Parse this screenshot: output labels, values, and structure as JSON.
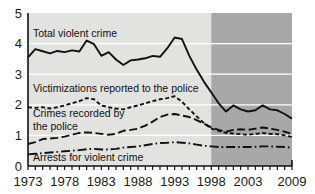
{
  "chart_data": {
    "type": "line",
    "title": "",
    "subtitle": "",
    "xlabel": "",
    "ylabel": "",
    "xlim": [
      1973,
      2009
    ],
    "ylim": [
      0,
      5
    ],
    "yticks": [
      "0",
      "1",
      "2",
      "3",
      "4",
      "5"
    ],
    "xticks": [
      "1973",
      "1978",
      "1983",
      "1988",
      "1993",
      "1998",
      "2003",
      "2009"
    ],
    "xtick_values": [
      1973,
      1978,
      1983,
      1988,
      1993,
      1998,
      2003,
      2009
    ],
    "grid": "horizontal white gridlines at 1,2,3,4",
    "legend": "inline annotations",
    "shaded_region": {
      "label": "",
      "from": 1998,
      "to": 2009,
      "color": "#a8a8a8"
    },
    "plot_background": "#e2e2e0",
    "x": [
      1973,
      1974,
      1975,
      1976,
      1977,
      1978,
      1979,
      1980,
      1981,
      1982,
      1983,
      1984,
      1985,
      1986,
      1987,
      1988,
      1989,
      1990,
      1991,
      1992,
      1993,
      1994,
      1995,
      1996,
      1997,
      1998,
      1999,
      2000,
      2001,
      2002,
      2003,
      2004,
      2005,
      2006,
      2007,
      2008,
      2009
    ],
    "series": [
      {
        "name": "Total violent crime",
        "style": "solid",
        "color": "#111111",
        "values": [
          3.55,
          3.82,
          3.75,
          3.68,
          3.76,
          3.72,
          3.78,
          3.74,
          4.1,
          3.98,
          3.6,
          3.72,
          3.48,
          3.3,
          3.45,
          3.48,
          3.52,
          3.6,
          3.57,
          3.85,
          4.2,
          4.15,
          3.6,
          3.15,
          2.75,
          2.4,
          2.05,
          1.78,
          1.98,
          1.85,
          1.78,
          1.82,
          1.98,
          1.85,
          1.82,
          1.7,
          1.55
        ]
      },
      {
        "name": "Victimizations reported to the police",
        "style": "dashed",
        "color": "#111111",
        "values": [
          1.92,
          1.9,
          1.92,
          1.88,
          1.92,
          1.98,
          2.05,
          2.12,
          2.22,
          2.18,
          1.98,
          1.92,
          1.88,
          1.85,
          1.92,
          1.98,
          2.05,
          2.12,
          2.18,
          2.22,
          2.28,
          2.1,
          1.85,
          1.62,
          1.4,
          1.22,
          1.15,
          1.08,
          1.06,
          1.04,
          1.02,
          1.05,
          1.08,
          1.05,
          1.04,
          1.0,
          0.95
        ]
      },
      {
        "name": "Crimes recorded by the police",
        "style": "long-dashed",
        "color": "#111111",
        "values": [
          0.72,
          0.78,
          0.88,
          0.9,
          0.92,
          0.96,
          1.02,
          1.08,
          1.1,
          1.08,
          1.05,
          1.02,
          1.05,
          1.15,
          1.18,
          1.22,
          1.32,
          1.45,
          1.6,
          1.68,
          1.7,
          1.65,
          1.6,
          1.5,
          1.38,
          1.26,
          1.18,
          1.12,
          1.18,
          1.2,
          1.18,
          1.22,
          1.26,
          1.22,
          1.18,
          1.12,
          1.05
        ]
      },
      {
        "name": "Arrests for violent crime",
        "style": "dash-dot",
        "color": "#111111",
        "values": [
          0.38,
          0.4,
          0.42,
          0.44,
          0.46,
          0.48,
          0.5,
          0.52,
          0.55,
          0.56,
          0.54,
          0.54,
          0.56,
          0.6,
          0.62,
          0.64,
          0.68,
          0.72,
          0.75,
          0.76,
          0.78,
          0.76,
          0.74,
          0.7,
          0.66,
          0.64,
          0.62,
          0.62,
          0.62,
          0.62,
          0.62,
          0.63,
          0.64,
          0.64,
          0.63,
          0.62,
          0.6
        ]
      }
    ],
    "annotations": [
      {
        "name": "total-violent-crime",
        "text": "Total violent crime"
      },
      {
        "name": "victimizations-reported",
        "text": "Victimizations reported to the police"
      },
      {
        "name": "crimes-recorded-line1",
        "text": "Crimes recorded by"
      },
      {
        "name": "crimes-recorded-line2",
        "text": "the police"
      },
      {
        "name": "arrests-for-violent-crime",
        "text": "Arrests for violent crime"
      }
    ]
  }
}
